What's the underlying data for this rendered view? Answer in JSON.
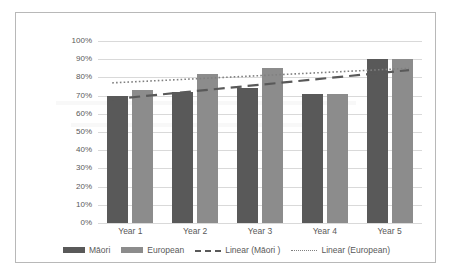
{
  "chart_data": {
    "type": "bar",
    "title": "",
    "xlabel": "",
    "ylabel": "",
    "categories": [
      "Year 1",
      "Year 2",
      "Year 3",
      "Year 4",
      "Year 5"
    ],
    "series": [
      {
        "name": "Māori",
        "color": "#595959",
        "values": [
          70,
          72,
          74,
          71,
          90
        ]
      },
      {
        "name": "European",
        "color": "#8c8c8c",
        "values": [
          73,
          82,
          85,
          71,
          90
        ]
      }
    ],
    "trendlines": [
      {
        "name": "Linear (Māori )",
        "style": "dashed",
        "color": "#595959",
        "start_value": 68,
        "end_value": 84
      },
      {
        "name": "Linear (European)",
        "style": "dotted",
        "color": "#808080",
        "start_value": 77,
        "end_value": 85
      }
    ],
    "ylim": [
      0,
      100
    ],
    "ytick_values": [
      0,
      10,
      20,
      30,
      40,
      50,
      60,
      70,
      80,
      90,
      100
    ],
    "ytick_labels": [
      "0%",
      "10%",
      "20%",
      "30%",
      "40%",
      "50%",
      "60%",
      "70%",
      "80%",
      "90%",
      "100%"
    ],
    "grid": true,
    "legend_position": "bottom"
  },
  "legend": {
    "items": [
      {
        "label": "Māori",
        "marker": "solid-box-dark"
      },
      {
        "label": "European",
        "marker": "solid-box-mid"
      },
      {
        "label": "Linear (Māori )",
        "marker": "dashed-line"
      },
      {
        "label": "Linear (European)",
        "marker": "dotted-line"
      }
    ]
  }
}
